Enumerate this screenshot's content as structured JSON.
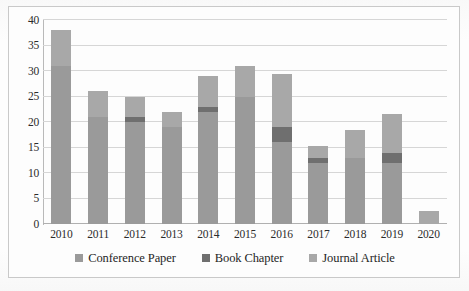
{
  "chart_data": {
    "type": "bar",
    "subtype": "stacked-bar",
    "title": "",
    "xlabel": "",
    "ylabel": "",
    "categories": [
      "2010",
      "2011",
      "2012",
      "2013",
      "2014",
      "2015",
      "2016",
      "2017",
      "2018",
      "2019",
      "2020"
    ],
    "series": [
      {
        "name": "Conference Paper",
        "color": "#9a9a9a",
        "values": [
          31,
          21,
          20,
          19,
          22,
          25,
          16,
          12,
          13,
          12,
          0
        ]
      },
      {
        "name": "Book Chapter",
        "color": "#6f6f6f",
        "values": [
          0,
          0,
          1,
          0,
          1,
          0,
          3,
          1,
          0,
          2,
          0
        ]
      },
      {
        "name": "Journal Article",
        "color": "#a8a8a8",
        "values": [
          7,
          5,
          4,
          3,
          6,
          6,
          10.5,
          2.3,
          5.4,
          7.5,
          2.5
        ]
      }
    ],
    "totals": [
      38,
      26,
      25,
      22,
      29.3,
      31.3,
      29.5,
      15.3,
      18.4,
      21.5,
      2.5
    ],
    "ylim": [
      0,
      40
    ],
    "yticks": [
      "0",
      "5",
      "10",
      "15",
      "20",
      "25",
      "30",
      "35",
      "40"
    ],
    "ytick_values": [
      0,
      5,
      10,
      15,
      20,
      25,
      30,
      35,
      40
    ],
    "grid": true,
    "legend_position": "bottom",
    "legend_entries": [
      "Conference Paper",
      "Book Chapter",
      "Journal Article"
    ]
  },
  "colors": {
    "conference_paper": "#9a9a9a",
    "book_chapter": "#6f6f6f",
    "journal_article": "#a8a8a8",
    "gridline": "#d6d6d6",
    "axis": "#b0b0b0",
    "border": "#c9c9c9",
    "text": "#2b2b2b",
    "background": "#fdfdfd"
  }
}
